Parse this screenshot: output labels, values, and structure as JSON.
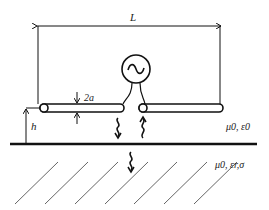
{
  "diagram": {
    "labels": {
      "length": "L",
      "radius": "2a",
      "height": "h",
      "upper_medium": "μ0, ε0",
      "lower_medium": "μ0, εr,σ",
      "source": "~"
    },
    "colors": {
      "stroke": "#111111",
      "hatch": "#555555",
      "background": "#ffffff"
    },
    "elements": {
      "source": "ac-voltage-source",
      "dipole": "two-arm-cylindrical-dipole",
      "ground": "lossy-half-space",
      "waves": [
        "downward-wave",
        "upward-reflected-wave",
        "transmitted-wave"
      ]
    }
  }
}
